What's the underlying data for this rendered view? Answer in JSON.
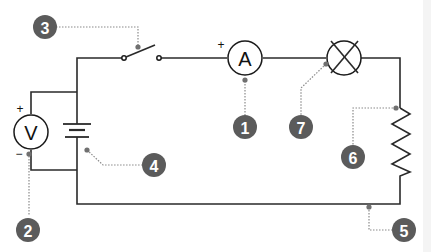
{
  "diagram": {
    "type": "electric circuit schematic",
    "components": {
      "ammeter": {
        "label": "A",
        "polarity": "+"
      },
      "voltmeter": {
        "label": "V",
        "polarity_top": "+",
        "polarity_bottom": "−"
      },
      "switch": {
        "state": "open"
      },
      "battery": {
        "cells": 1
      },
      "lamp": {
        "symbol": "crossed-circle"
      },
      "resistor": {
        "symbol": "zigzag"
      }
    },
    "callouts": [
      {
        "number": "1",
        "points_to": "ammeter"
      },
      {
        "number": "2",
        "points_to": "voltmeter"
      },
      {
        "number": "3",
        "points_to": "switch"
      },
      {
        "number": "4",
        "points_to": "battery"
      },
      {
        "number": "5",
        "points_to": "wire"
      },
      {
        "number": "6",
        "points_to": "resistor"
      },
      {
        "number": "7",
        "points_to": "lamp"
      }
    ],
    "colors": {
      "wire": "#2a2a2a",
      "badge": "#5b5b5b",
      "leader": "#8a8a8a"
    }
  }
}
